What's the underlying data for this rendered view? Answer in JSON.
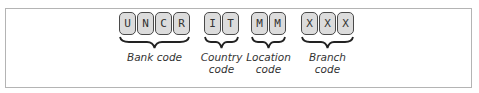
{
  "diagram": {
    "groups": [
      {
        "chars": [
          "U",
          "N",
          "C",
          "R"
        ],
        "label_lines": [
          "Bank code"
        ]
      },
      {
        "chars": [
          "I",
          "T"
        ],
        "label_lines": [
          "Country",
          "code"
        ]
      },
      {
        "chars": [
          "M",
          "M"
        ],
        "label_lines": [
          "Location",
          "code"
        ]
      },
      {
        "chars": [
          "X",
          "X",
          "X"
        ],
        "label_lines": [
          "Branch",
          "code"
        ]
      }
    ]
  },
  "colors": {
    "box_fill": "#dcdcdc",
    "box_border": "#4a4a4a",
    "frame_border": "#b4b4b4"
  }
}
